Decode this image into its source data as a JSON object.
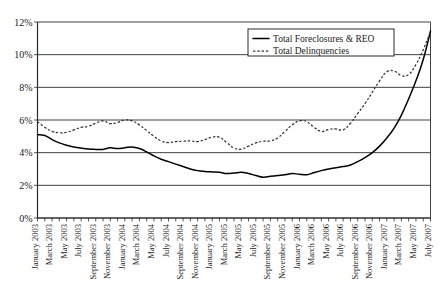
{
  "chart_data": {
    "type": "line",
    "title": "",
    "xlabel": "",
    "ylabel": "",
    "ylim": [
      0,
      12
    ],
    "ytick_labels": [
      "0%",
      "2%",
      "4%",
      "6%",
      "8%",
      "10%",
      "12%"
    ],
    "ytick_values": [
      0,
      2,
      4,
      6,
      8,
      10,
      12
    ],
    "grid": true,
    "legend_position": "top-right",
    "x": [
      "January 2003",
      "February 2003",
      "March 2003",
      "April 2003",
      "May 2003",
      "June 2003",
      "July 2003",
      "August 2003",
      "September 2003",
      "October 2003",
      "November 2003",
      "December 2003",
      "January 2004",
      "February 2004",
      "March 2004",
      "April 2004",
      "May 2004",
      "June 2004",
      "July 2004",
      "August 2004",
      "September 2004",
      "October 2004",
      "November 2004",
      "December 2004",
      "January 2005",
      "February 2005",
      "March 2005",
      "April 2005",
      "May 2005",
      "June 2005",
      "July 2005",
      "August 2005",
      "September 2005",
      "October 2005",
      "November 2005",
      "December 2005",
      "January 2006",
      "February 2006",
      "March 2006",
      "April 2006",
      "May 2006",
      "June 2006",
      "July 2006",
      "August 2006",
      "September 2006",
      "October 2006",
      "November 2006",
      "December 2006",
      "January 2007",
      "February 2007",
      "March 2007",
      "April 2007",
      "May 2007",
      "June 2007",
      "July 2007"
    ],
    "xtick_labels": [
      "January 2003",
      "March 2003",
      "May 2003",
      "July 2003",
      "September 2003",
      "November 2003",
      "January 2004",
      "March 2004",
      "May 2004",
      "July 2004",
      "September 2004",
      "November 2004",
      "January 2005",
      "March 2005",
      "May 2005",
      "July 2005",
      "September 2005",
      "November 2005",
      "January 2006",
      "March 2006",
      "May 2006",
      "July 2006",
      "September 2006",
      "November 2006",
      "January 2007",
      "March 2007",
      "May 2007",
      "July 2007"
    ],
    "series": [
      {
        "name": "Total Foreclosures & REO",
        "style": "solid",
        "color": "#000000",
        "values": [
          5.1,
          5.05,
          4.8,
          4.6,
          4.45,
          4.35,
          4.28,
          4.22,
          4.2,
          4.2,
          4.3,
          4.25,
          4.3,
          4.35,
          4.25,
          4.05,
          3.8,
          3.6,
          3.45,
          3.3,
          3.15,
          3.0,
          2.9,
          2.85,
          2.82,
          2.8,
          2.72,
          2.75,
          2.8,
          2.72,
          2.6,
          2.5,
          2.55,
          2.6,
          2.65,
          2.72,
          2.68,
          2.65,
          2.78,
          2.9,
          3.0,
          3.08,
          3.15,
          3.25,
          3.45,
          3.7,
          4.0,
          4.4,
          4.9,
          5.5,
          6.3,
          7.3,
          8.4,
          9.7,
          11.45
        ]
      },
      {
        "name": "Total Delinquencies",
        "style": "dashed",
        "color": "#333333",
        "values": [
          5.9,
          5.55,
          5.3,
          5.22,
          5.25,
          5.4,
          5.55,
          5.62,
          5.8,
          5.95,
          5.78,
          5.85,
          6.0,
          5.95,
          5.7,
          5.35,
          5.0,
          4.72,
          4.62,
          4.68,
          4.7,
          4.72,
          4.68,
          4.8,
          4.95,
          4.95,
          4.62,
          4.28,
          4.22,
          4.4,
          4.6,
          4.7,
          4.72,
          4.9,
          5.3,
          5.7,
          5.95,
          5.9,
          5.55,
          5.3,
          5.42,
          5.45,
          5.4,
          5.8,
          6.4,
          7.0,
          7.7,
          8.4,
          8.95,
          9.0,
          8.72,
          8.78,
          9.4,
          10.3,
          11.4
        ]
      }
    ],
    "legend": [
      {
        "label": "Total Foreclosures & REO",
        "style": "solid"
      },
      {
        "label": "Total Delinquencies",
        "style": "dashed"
      }
    ]
  }
}
